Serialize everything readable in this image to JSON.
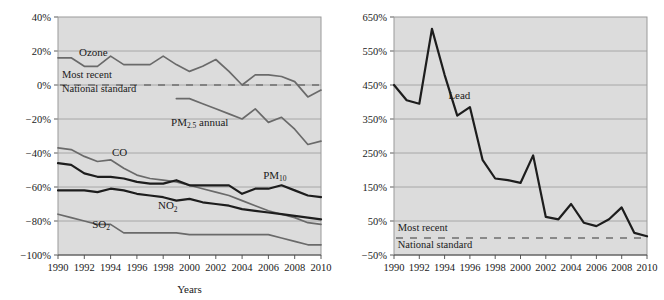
{
  "chart_data": [
    {
      "id": "left",
      "type": "line",
      "title": "",
      "xlabel": "Years",
      "ylabel": "",
      "xlim": [
        1990,
        2010
      ],
      "ylim": [
        -100,
        40
      ],
      "ytick_labels": [
        "40%",
        "20%",
        "0%",
        "−20%",
        "−40%",
        "−60%",
        "−80%",
        "−100%"
      ],
      "ytick_values": [
        40,
        20,
        0,
        -20,
        -40,
        -60,
        -80,
        -100
      ],
      "xtick_labels": [
        "1990",
        "1992",
        "1994",
        "1996",
        "1998",
        "2000",
        "2002",
        "2004",
        "2006",
        "2008",
        "2010"
      ],
      "xtick_values": [
        1990,
        1992,
        1994,
        1996,
        1998,
        2000,
        2002,
        2004,
        2006,
        2008,
        2010
      ],
      "grid": true,
      "legend_position": "inline-annotations",
      "annotations": [
        {
          "name": "most-recent",
          "text": "Most recent",
          "x": 1990.3,
          "y": 4
        },
        {
          "name": "national-standard",
          "text": "National standard",
          "x": 1990.3,
          "y": -4
        }
      ],
      "reference_line": {
        "name": "national-standard-line",
        "value": 0,
        "style": "dashed"
      },
      "series": [
        {
          "name": "Ozone",
          "label": "Ozone",
          "label_x": 1991.6,
          "label_y": 17,
          "weight": "mid",
          "x": [
            1990,
            1991,
            1992,
            1993,
            1994,
            1995,
            1996,
            1997,
            1998,
            1999,
            2000,
            2001,
            2002,
            2003,
            2004,
            2005,
            2006,
            2007,
            2008,
            2009,
            2010
          ],
          "values": [
            16,
            16,
            11,
            11,
            17,
            12,
            12,
            12,
            17,
            12,
            8,
            11,
            15,
            8,
            0,
            6,
            6,
            5,
            2,
            -7,
            -3
          ]
        },
        {
          "name": "PM2.5 annual",
          "label": "PM",
          "label_sub": "2.5",
          "label_suffix": " annual",
          "label_x": 1998.6,
          "label_y": -24,
          "weight": "mid",
          "x": [
            1999,
            2000,
            2001,
            2002,
            2003,
            2004,
            2005,
            2006,
            2007,
            2008,
            2009,
            2010
          ],
          "values": [
            -8,
            -8,
            -11,
            -14,
            -17,
            -20,
            -14,
            -22,
            -19,
            -26,
            -35,
            -33
          ]
        },
        {
          "name": "CO",
          "label": "CO",
          "label_x": 1994.1,
          "label_y": -42,
          "weight": "mid",
          "x": [
            1990,
            1991,
            1992,
            1993,
            1994,
            1995,
            1996,
            1997,
            1998,
            1999,
            2000,
            2001,
            2002,
            2003,
            2004,
            2005,
            2006,
            2007,
            2008,
            2009,
            2010
          ],
          "values": [
            -37,
            -38,
            -42,
            -45,
            -44,
            -49,
            -53,
            -55,
            -56,
            -57,
            -59,
            -61,
            -63,
            -65,
            -68,
            -71,
            -74,
            -76,
            -78,
            -81,
            -82
          ]
        },
        {
          "name": "PM10",
          "label": "PM",
          "label_sub": "10",
          "label_x": 2005.6,
          "label_y": -55,
          "weight": "dark",
          "x": [
            1990,
            1991,
            1992,
            1993,
            1994,
            1995,
            1996,
            1997,
            1998,
            1999,
            2000,
            2001,
            2002,
            2003,
            2004,
            2005,
            2006,
            2007,
            2008,
            2009,
            2010
          ],
          "values": [
            -46,
            -47,
            -52,
            -54,
            -54,
            -55,
            -57,
            -58,
            -58,
            -56,
            -59,
            -59,
            -59,
            -59,
            -64,
            -61,
            -61,
            -59,
            -62,
            -65,
            -66
          ]
        },
        {
          "name": "NO2",
          "label": "NO",
          "label_sub": "2",
          "label_x": 1997.6,
          "label_y": -73,
          "weight": "dark",
          "x": [
            1990,
            1991,
            1992,
            1993,
            1994,
            1995,
            1996,
            1997,
            1998,
            1999,
            2000,
            2001,
            2002,
            2003,
            2004,
            2005,
            2006,
            2007,
            2008,
            2009,
            2010
          ],
          "values": [
            -62,
            -62,
            -62,
            -63,
            -61,
            -62,
            -64,
            -65,
            -66,
            -68,
            -67,
            -69,
            -70,
            -71,
            -73,
            -74,
            -75,
            -76,
            -77,
            -78,
            -79
          ]
        },
        {
          "name": "SO2",
          "label": "SO",
          "label_sub": "2",
          "label_x": 1992.6,
          "label_y": -84,
          "weight": "mid",
          "x": [
            1990,
            1991,
            1992,
            1993,
            1994,
            1995,
            1996,
            1997,
            1998,
            1999,
            2000,
            2001,
            2002,
            2003,
            2004,
            2005,
            2006,
            2007,
            2008,
            2009,
            2010
          ],
          "values": [
            -76,
            -78,
            -80,
            -82,
            -82,
            -87,
            -87,
            -87,
            -87,
            -87,
            -88,
            -88,
            -88,
            -88,
            -88,
            -88,
            -88,
            -90,
            -92,
            -94,
            -94
          ]
        }
      ]
    },
    {
      "id": "right",
      "type": "line",
      "title": "",
      "xlabel": "",
      "ylabel": "",
      "xlim": [
        1990,
        2010
      ],
      "ylim": [
        -50,
        650
      ],
      "ytick_labels": [
        "650%",
        "550%",
        "450%",
        "350%",
        "250%",
        "150%",
        "50%",
        "−50%"
      ],
      "ytick_values": [
        650,
        550,
        450,
        350,
        250,
        150,
        50,
        -50
      ],
      "xtick_labels": [
        "1990",
        "1992",
        "1994",
        "1996",
        "1998",
        "2000",
        "2002",
        "2004",
        "2006",
        "2008",
        "2010"
      ],
      "xtick_values": [
        1990,
        1992,
        1994,
        1996,
        1998,
        2000,
        2002,
        2004,
        2006,
        2008,
        2010
      ],
      "grid": true,
      "legend_position": "inline-annotations",
      "annotations": [
        {
          "name": "most-recent",
          "text": "Most recent",
          "x": 1990.3,
          "y": 22
        },
        {
          "name": "national-standard",
          "text": "National standard",
          "x": 1990.3,
          "y": -28
        }
      ],
      "reference_line": {
        "name": "national-standard-line",
        "value": 0,
        "style": "dashed"
      },
      "series": [
        {
          "name": "Lead",
          "label": "Lead",
          "label_x": 1994.3,
          "label_y": 410,
          "weight": "dark",
          "x": [
            1990,
            1991,
            1992,
            1993,
            1994,
            1995,
            1996,
            1997,
            1998,
            1999,
            2000,
            2001,
            2002,
            2003,
            2004,
            2005,
            2006,
            2007,
            2008,
            2009,
            2010
          ],
          "values": [
            450,
            405,
            395,
            615,
            480,
            360,
            385,
            230,
            175,
            170,
            162,
            243,
            62,
            55,
            100,
            45,
            35,
            55,
            90,
            15,
            5
          ]
        }
      ]
    }
  ]
}
